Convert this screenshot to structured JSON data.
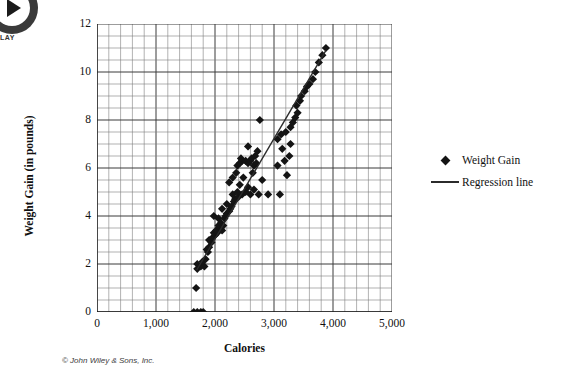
{
  "overlay": {
    "play_icon_name": "play-icon",
    "play_label": "LAY"
  },
  "footer": {
    "copyright": "© John Wiley & Sons, Inc."
  },
  "legend": {
    "position": "right",
    "entries": [
      {
        "label": "Weight Gain",
        "symbol": "diamond",
        "color": "#141414"
      },
      {
        "label": "Regression line",
        "symbol": "line",
        "color": "#2b2b2b"
      }
    ]
  },
  "chart_data": {
    "type": "scatter",
    "title": "",
    "xlabel": "Calories",
    "ylabel": "Weight Gain (in pounds)",
    "xlim": [
      0,
      5000
    ],
    "ylim": [
      0,
      12
    ],
    "xticks": [
      0,
      1000,
      2000,
      3000,
      4000,
      5000
    ],
    "xticklabels": [
      "0",
      "1,000",
      "2,000",
      "3,000",
      "4,000",
      "5,000"
    ],
    "yticks": [
      0,
      2,
      4,
      6,
      8,
      10,
      12
    ],
    "yticklabels": [
      "0",
      "2",
      "4",
      "6",
      "8",
      "10",
      "12"
    ],
    "grid": true,
    "grid_minor_x": 200,
    "grid_minor_y": 0.5,
    "series": [
      {
        "name": "Weight Gain",
        "type": "scatter",
        "marker": "diamond",
        "color": "#141414",
        "points": [
          [
            1640,
            0.0
          ],
          [
            1700,
            0.0
          ],
          [
            1760,
            0.0
          ],
          [
            1800,
            0.0
          ],
          [
            1680,
            1.0
          ],
          [
            1700,
            1.8
          ],
          [
            1760,
            1.9
          ],
          [
            1820,
            1.9
          ],
          [
            1700,
            2.0
          ],
          [
            1790,
            2.1
          ],
          [
            1840,
            2.2
          ],
          [
            1880,
            2.5
          ],
          [
            1860,
            2.6
          ],
          [
            1900,
            2.7
          ],
          [
            1940,
            2.9
          ],
          [
            1900,
            3.0
          ],
          [
            1960,
            3.1
          ],
          [
            2000,
            3.2
          ],
          [
            1980,
            3.3
          ],
          [
            2040,
            3.3
          ],
          [
            2020,
            3.4
          ],
          [
            2080,
            3.5
          ],
          [
            2060,
            3.6
          ],
          [
            2100,
            3.7
          ],
          [
            2120,
            3.4
          ],
          [
            2140,
            3.6
          ],
          [
            2060,
            3.9
          ],
          [
            2160,
            3.9
          ],
          [
            1980,
            4.0
          ],
          [
            2180,
            4.0
          ],
          [
            2200,
            4.1
          ],
          [
            2240,
            4.2
          ],
          [
            2120,
            4.3
          ],
          [
            2260,
            4.3
          ],
          [
            2280,
            4.4
          ],
          [
            2200,
            4.5
          ],
          [
            2320,
            4.6
          ],
          [
            2340,
            4.7
          ],
          [
            2400,
            4.8
          ],
          [
            2300,
            4.9
          ],
          [
            2460,
            4.9
          ],
          [
            2600,
            4.9
          ],
          [
            2740,
            4.9
          ],
          [
            2900,
            4.9
          ],
          [
            3100,
            4.9
          ],
          [
            2380,
            5.0
          ],
          [
            2520,
            5.0
          ],
          [
            2660,
            5.1
          ],
          [
            2560,
            5.2
          ],
          [
            2420,
            5.3
          ],
          [
            2240,
            5.4
          ],
          [
            2800,
            5.5
          ],
          [
            2300,
            5.6
          ],
          [
            2480,
            5.6
          ],
          [
            2360,
            5.8
          ],
          [
            2640,
            5.8
          ],
          [
            3220,
            5.7
          ],
          [
            3060,
            6.1
          ],
          [
            2380,
            6.1
          ],
          [
            2420,
            6.2
          ],
          [
            2460,
            6.3
          ],
          [
            2520,
            6.3
          ],
          [
            2560,
            6.2
          ],
          [
            2600,
            6.3
          ],
          [
            2660,
            6.1
          ],
          [
            2700,
            6.2
          ],
          [
            3180,
            6.3
          ],
          [
            2440,
            6.4
          ],
          [
            2620,
            6.4
          ],
          [
            2680,
            6.5
          ],
          [
            3260,
            6.5
          ],
          [
            2720,
            6.7
          ],
          [
            2560,
            6.9
          ],
          [
            3140,
            6.8
          ],
          [
            3280,
            7.0
          ],
          [
            3060,
            7.2
          ],
          [
            3120,
            7.4
          ],
          [
            3200,
            7.5
          ],
          [
            3280,
            7.7
          ],
          [
            3320,
            7.9
          ],
          [
            2760,
            8.0
          ],
          [
            3360,
            8.1
          ],
          [
            3400,
            8.3
          ],
          [
            3380,
            8.6
          ],
          [
            3440,
            8.8
          ],
          [
            3460,
            9.0
          ],
          [
            3520,
            9.2
          ],
          [
            3560,
            9.4
          ],
          [
            3600,
            9.5
          ],
          [
            3660,
            9.7
          ],
          [
            3700,
            10.0
          ],
          [
            3760,
            10.4
          ],
          [
            3820,
            10.7
          ],
          [
            3880,
            11.0
          ]
        ]
      },
      {
        "name": "Regression line",
        "type": "line",
        "color": "#2b2b2b",
        "endpoints": [
          [
            1690,
            1.75
          ],
          [
            3880,
            10.9
          ]
        ]
      }
    ]
  }
}
